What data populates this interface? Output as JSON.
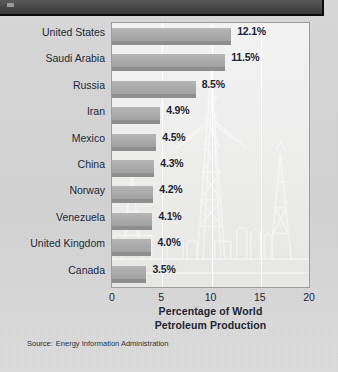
{
  "header": {
    "banner_label": "document-header-bar"
  },
  "chart_data": {
    "type": "bar",
    "orientation": "horizontal",
    "title": "Percentage of World Petroleum Production",
    "xlabel_line1": "Percentage of World",
    "xlabel_line2": "Petroleum Production",
    "ylabel": "",
    "xlim": [
      0,
      20
    ],
    "grid": true,
    "legend": "none",
    "categories": [
      "United States",
      "Saudi Arabia",
      "Russia",
      "Iran",
      "Mexico",
      "China",
      "Norway",
      "Venezuela",
      "United Kingdom",
      "Canada"
    ],
    "values": [
      12.1,
      11.5,
      8.5,
      4.9,
      4.5,
      4.3,
      4.2,
      4.1,
      4.0,
      3.5
    ],
    "value_labels": [
      "12.1%",
      "11.5%",
      "8.5%",
      "4.9%",
      "4.5%",
      "4.3%",
      "4.2%",
      "4.1%",
      "4.0%",
      "3.5%"
    ],
    "xticks": [
      0,
      5,
      10,
      15,
      20
    ],
    "xtick_labels": [
      "0",
      "5",
      "10",
      "15",
      "20"
    ],
    "bar_color": "#aaaaaa",
    "bar_shadow_color": "#8e8e8e",
    "plot_background": "#f0f0ef",
    "text_color": "#1d2533",
    "gridline_color": "#ffffff",
    "background_art": "oil-derrick-watermark"
  },
  "source": {
    "lead": "Source:",
    "text": "Energy Information Administration"
  }
}
